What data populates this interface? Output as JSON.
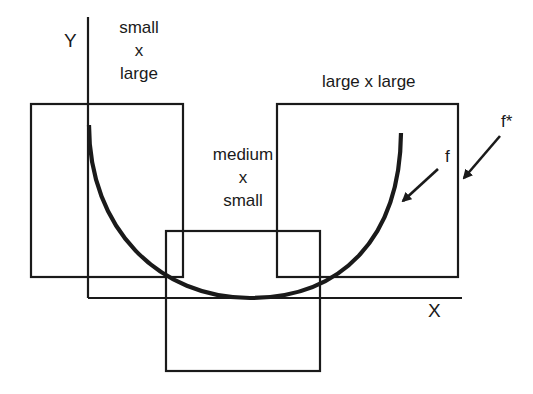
{
  "diagram": {
    "axes": {
      "y_label": "Y",
      "x_label": "X"
    },
    "boxes": [
      {
        "id": "small-x-large",
        "lines": [
          "small",
          "x",
          "large"
        ]
      },
      {
        "id": "medium-x-small",
        "lines": [
          "medium",
          "x",
          "small"
        ]
      },
      {
        "id": "large-x-large",
        "lines": [
          "large x large"
        ]
      }
    ],
    "curve_label": "f",
    "outer_label": "f*",
    "colors": {
      "stroke": "#1a1a1a",
      "background": "#ffffff"
    }
  }
}
